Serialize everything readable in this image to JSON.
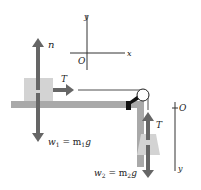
{
  "diagram": {
    "colors": {
      "arrow": "#666666",
      "block": "#d3d3d3",
      "table": "#a9a9a9",
      "string": "#222222",
      "axis": "#333333",
      "pulley_bracket": "#111111"
    },
    "axes_top": {
      "x_label": "x",
      "y_label": "y",
      "origin_label": "O"
    },
    "axes_right": {
      "origin_label": "O",
      "y_label": "y"
    },
    "block1": {
      "normal_label": "n",
      "tension_label": "T",
      "weight_label_w": "w",
      "weight_sub": "1",
      "weight_eq": " = m",
      "weight_sub2": "1",
      "weight_g": "g"
    },
    "block2": {
      "tension_label": "T",
      "weight_label_w": "w",
      "weight_sub": "2",
      "weight_eq": " = m",
      "weight_sub2": "2",
      "weight_g": "g"
    }
  }
}
